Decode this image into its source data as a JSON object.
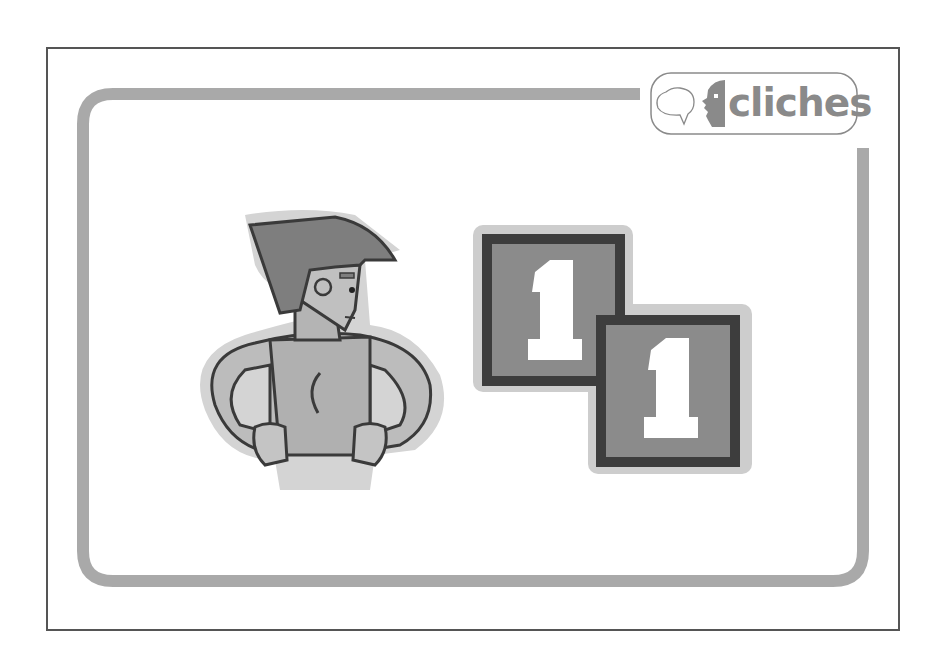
{
  "card": {
    "frame_color": "#555555",
    "border_color": "#a9a9a9",
    "background": "#ffffff"
  },
  "logo": {
    "text": "cliches",
    "icon": "speech-bubble-face-icon",
    "text_color": "#8a8a8a"
  },
  "illustration": {
    "figure": "man-hands-on-chest-illustration",
    "number_tiles": [
      {
        "label": "1"
      },
      {
        "label": "1"
      }
    ],
    "meaning": "number one"
  }
}
